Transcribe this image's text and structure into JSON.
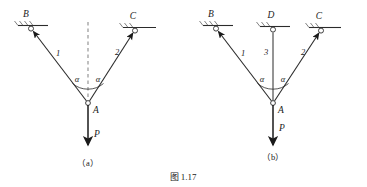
{
  "figure": {
    "caption": "图 1.17",
    "subcaption_a": "（a）",
    "subcaption_b": "（b）"
  },
  "panel_a": {
    "name": "two-bar-truss",
    "supports": [
      {
        "label": "B",
        "type": "pin-support",
        "x": 31,
        "y": 28
      },
      {
        "label": "C",
        "type": "pin-support",
        "x": 135,
        "y": 30
      }
    ],
    "joint": {
      "label": "A",
      "x": 88,
      "y": 103
    },
    "members": [
      {
        "label": "1",
        "from": "B",
        "to": "A"
      },
      {
        "label": "2",
        "from": "C",
        "to": "A"
      }
    ],
    "angles": [
      {
        "label": "α",
        "side": "left"
      },
      {
        "label": "α",
        "side": "right"
      }
    ],
    "load": {
      "label": "P",
      "direction": "down"
    },
    "centerline": {
      "type": "dashed-vertical",
      "visible": true
    }
  },
  "panel_b": {
    "name": "three-bar-truss",
    "supports": [
      {
        "label": "B",
        "type": "pin-support",
        "x": 216,
        "y": 28
      },
      {
        "label": "D",
        "type": "pin-support",
        "x": 273,
        "y": 29
      },
      {
        "label": "C",
        "type": "pin-support",
        "x": 321,
        "y": 30
      }
    ],
    "joint": {
      "label": "A",
      "x": 273,
      "y": 103
    },
    "members": [
      {
        "label": "1",
        "from": "B",
        "to": "A"
      },
      {
        "label": "3",
        "from": "D",
        "to": "A"
      },
      {
        "label": "2",
        "from": "C",
        "to": "A"
      }
    ],
    "angles": [
      {
        "label": "α",
        "side": "left"
      },
      {
        "label": "α",
        "side": "right"
      }
    ],
    "load": {
      "label": "P",
      "direction": "down"
    },
    "centerline": {
      "type": "member-vertical",
      "visible": true
    }
  },
  "colors": {
    "ink": "#1a1a1a",
    "line": "#2b2b2b",
    "dashed": "#8c8c8c",
    "background": "#ffffff"
  }
}
